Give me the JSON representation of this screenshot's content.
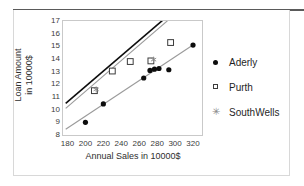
{
  "chart_data": {
    "type": "scatter",
    "title": "",
    "xlabel": "Annual Sales in 10000$",
    "ylabel_line1": "Loan Amount",
    "ylabel_line2": "in 10000$",
    "xlim": [
      175,
      330
    ],
    "ylim": [
      8,
      17
    ],
    "xticks": [
      180,
      200,
      220,
      240,
      260,
      280,
      300,
      320
    ],
    "yticks": [
      8,
      9,
      10,
      11,
      12,
      13,
      14,
      15,
      16,
      17
    ],
    "grid": false,
    "legend_position": "right",
    "series": [
      {
        "name": "Aderly",
        "marker": "filled-circle",
        "color": "#0d0d0d",
        "points": [
          {
            "x": 200,
            "y": 9.0
          },
          {
            "x": 220,
            "y": 10.45
          },
          {
            "x": 265,
            "y": 12.5
          },
          {
            "x": 272,
            "y": 13.1
          },
          {
            "x": 277,
            "y": 13.2
          },
          {
            "x": 282,
            "y": 13.25
          },
          {
            "x": 293,
            "y": 13.15
          },
          {
            "x": 320,
            "y": 15.1
          }
        ]
      },
      {
        "name": "Purth",
        "marker": "open-square",
        "color": "#3c3c3c",
        "points": [
          {
            "x": 210,
            "y": 11.5
          },
          {
            "x": 230,
            "y": 13.05
          },
          {
            "x": 250,
            "y": 13.8
          },
          {
            "x": 273,
            "y": 13.85
          },
          {
            "x": 295,
            "y": 15.3
          }
        ]
      },
      {
        "name": "SouthWells",
        "marker": "asterisk",
        "color": "#8a8a8a",
        "points": [
          {
            "x": 212,
            "y": 11.6
          },
          {
            "x": 276,
            "y": 13.95
          }
        ]
      }
    ],
    "trend_lines": [
      {
        "name": "dark-steep-line",
        "color": "#0d0d0d",
        "width": 1.6,
        "x0": 178,
        "y0": 10.5,
        "x1": 286,
        "y1": 17.05
      },
      {
        "name": "gray-upper-line",
        "color": "#9a9a9a",
        "width": 1.1,
        "x0": 178,
        "y0": 10.1,
        "x1": 292,
        "y1": 17.05
      },
      {
        "name": "gray-lower-line",
        "color": "#9a9a9a",
        "width": 1.1,
        "x0": 178,
        "y0": 8.45,
        "x1": 322,
        "y1": 15.2
      }
    ]
  },
  "legend": {
    "items": [
      {
        "label": "Aderly",
        "marker": "filled-circle"
      },
      {
        "label": "Purth",
        "marker": "open-square"
      },
      {
        "label": "SouthWells",
        "marker": "asterisk"
      }
    ]
  },
  "axes": {
    "x_title": "Annual Sales in 10000$",
    "y_title_line1": "Loan Amount",
    "y_title_line2": "in 10000$",
    "x_tick_labels": [
      "180",
      "200",
      "220",
      "240",
      "260",
      "280",
      "300",
      "320"
    ],
    "y_tick_labels": [
      "17",
      "16",
      "15",
      "14",
      "13",
      "12",
      "11",
      "10",
      "9",
      "8"
    ]
  },
  "icons": {
    "asterisk_glyph": "✳"
  }
}
